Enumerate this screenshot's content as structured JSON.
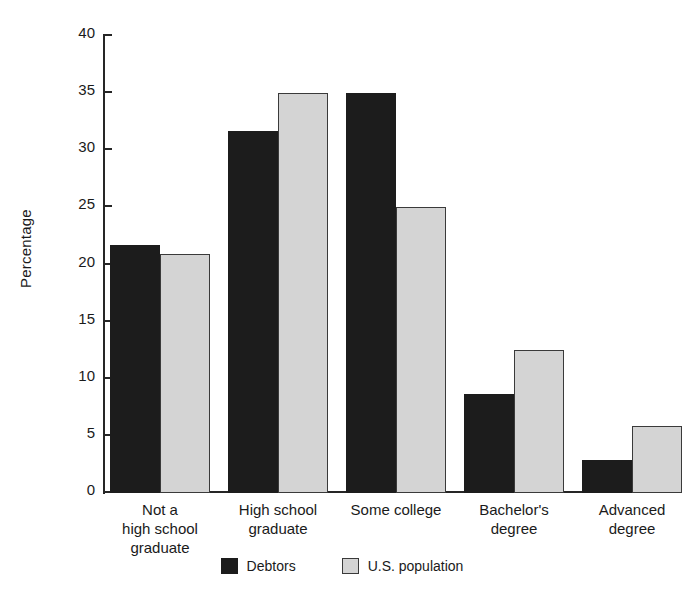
{
  "chart_data": {
    "type": "bar",
    "title": "",
    "xlabel": "",
    "ylabel": "Percentage",
    "ylim": [
      0,
      40
    ],
    "yticks": [
      0,
      5,
      10,
      15,
      20,
      25,
      30,
      35,
      40
    ],
    "grid": false,
    "legend_position": "bottom-center",
    "categories": [
      "Not a\nhigh school\ngraduate",
      "High school\ngraduate",
      "Some college",
      "Bachelor's\ndegree",
      "Advanced\ndegree"
    ],
    "category_lines": [
      [
        "Not a",
        "high school",
        "graduate"
      ],
      [
        "High school",
        "graduate"
      ],
      [
        "Some college"
      ],
      [
        "Bachelor's",
        "degree"
      ],
      [
        "Advanced",
        "degree"
      ]
    ],
    "series": [
      {
        "name": "Debtors",
        "color": "#1c1c1c",
        "values": [
          21.7,
          31.7,
          35.0,
          8.7,
          2.9
        ]
      },
      {
        "name": "U.S. population",
        "color": "#d4d4d4",
        "values": [
          20.9,
          35.0,
          25.0,
          12.5,
          5.9
        ]
      }
    ]
  },
  "legend": {
    "items": [
      {
        "label": "Debtors"
      },
      {
        "label": "U.S. population"
      }
    ]
  },
  "axis": {
    "y_title": "Percentage",
    "tick_labels": [
      "0",
      "5",
      "10",
      "15",
      "20",
      "25",
      "30",
      "35",
      "40"
    ]
  },
  "colors": {
    "debtors": "#1c1c1c",
    "us_population": "#d4d4d4",
    "axis": "#262626",
    "text": "#1a1a1a",
    "background": "#ffffff"
  }
}
